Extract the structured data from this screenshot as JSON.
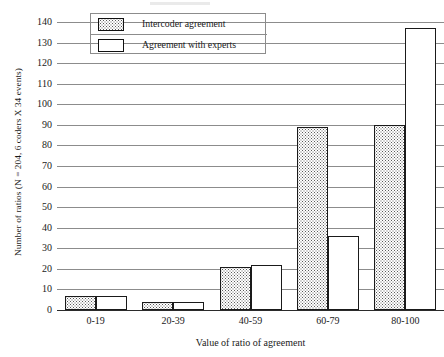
{
  "chart_data": {
    "type": "bar",
    "title": "",
    "subtitle": "",
    "xlabel": "Value of ratio of agreement",
    "ylabel": "Number of ratios (N = 204, 6 coders X 34 events)",
    "categories": [
      "0-19",
      "20-39",
      "40-59",
      "60-79",
      "80-100"
    ],
    "series": [
      {
        "name": "Intercoder agreement",
        "values": [
          7,
          4,
          21,
          89,
          90
        ]
      },
      {
        "name": "Agreement with experts",
        "values": [
          7,
          4,
          22,
          36,
          137
        ]
      }
    ],
    "ylim": [
      0,
      140
    ],
    "ytick_step": 10,
    "yticks": [
      0,
      10,
      20,
      30,
      40,
      50,
      60,
      70,
      80,
      90,
      100,
      110,
      120,
      130,
      140
    ],
    "ytick_labels": [
      "0",
      "10",
      "20",
      "30",
      "40",
      "50",
      "60",
      "70",
      "80",
      "90",
      "100",
      "110",
      "120",
      "130",
      "140"
    ],
    "grid": true,
    "grid_axis": "y",
    "legend_position": "top-left",
    "bar_style": {
      "series_0_fill": "dotted-stipple",
      "series_1_fill": "white",
      "edge_color": "#1a1a1a"
    },
    "colors": {
      "gridline": "#8c8c8c",
      "axis": "#2b2b2b",
      "text": "#1a1a1a",
      "stipple": "#5a5a5a",
      "background": "#ffffff"
    }
  },
  "legend": {
    "entries": [
      {
        "label": "Intercoder agreement",
        "swatch": "dotted-swatch"
      },
      {
        "label": "Agreement with experts",
        "swatch": "white-swatch"
      }
    ]
  },
  "axes": {
    "x_title": "Value of ratio of agreement",
    "y_title": "Number of ratios (N = 204, 6 coders X 34 events)"
  }
}
